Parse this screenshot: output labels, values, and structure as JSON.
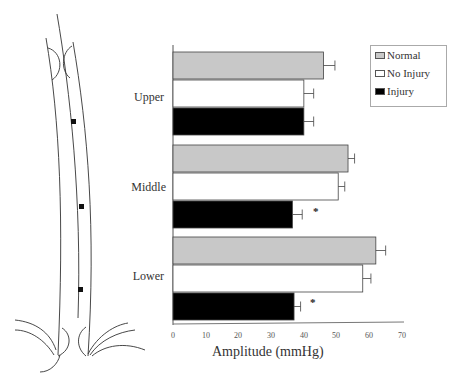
{
  "chart_data": {
    "type": "bar",
    "orientation": "horizontal",
    "title": "",
    "xlabel": "Amplitude (mmHg)",
    "ylabel": "",
    "xlim": [
      0,
      70
    ],
    "xticks": [
      0,
      10,
      20,
      30,
      40,
      50,
      60,
      70
    ],
    "grid": false,
    "legend_position": "upper right",
    "categories": [
      "Upper",
      "Middle",
      "Lower"
    ],
    "series": [
      {
        "name": "Normal",
        "color": "#c8c8c8",
        "values": [
          46,
          53.5,
          62
        ],
        "errors": [
          3.5,
          2,
          3
        ]
      },
      {
        "name": "No Injury",
        "color": "#ffffff",
        "values": [
          40,
          50.5,
          58
        ],
        "errors": [
          3,
          2,
          2.5
        ]
      },
      {
        "name": "Injury",
        "color": "#000000",
        "values": [
          40,
          36.5,
          37
        ],
        "errors": [
          3,
          3,
          2
        ]
      }
    ],
    "annotations": [
      {
        "category": "Middle",
        "series": "Injury",
        "text": "*"
      },
      {
        "category": "Lower",
        "series": "Injury",
        "text": "*"
      }
    ]
  },
  "labels": {
    "upper": "Upper",
    "middle": "Middle",
    "lower": "Lower",
    "xlabel": "Amplitude (mmHg)",
    "ticks": [
      "0",
      "10",
      "20",
      "30",
      "40",
      "50",
      "60",
      "70"
    ],
    "legend": [
      "Normal",
      "No Injury",
      "Injury"
    ],
    "star": "*"
  },
  "diagram": {
    "markers": [
      "upper-sensor",
      "middle-sensor",
      "lower-sensor"
    ]
  }
}
